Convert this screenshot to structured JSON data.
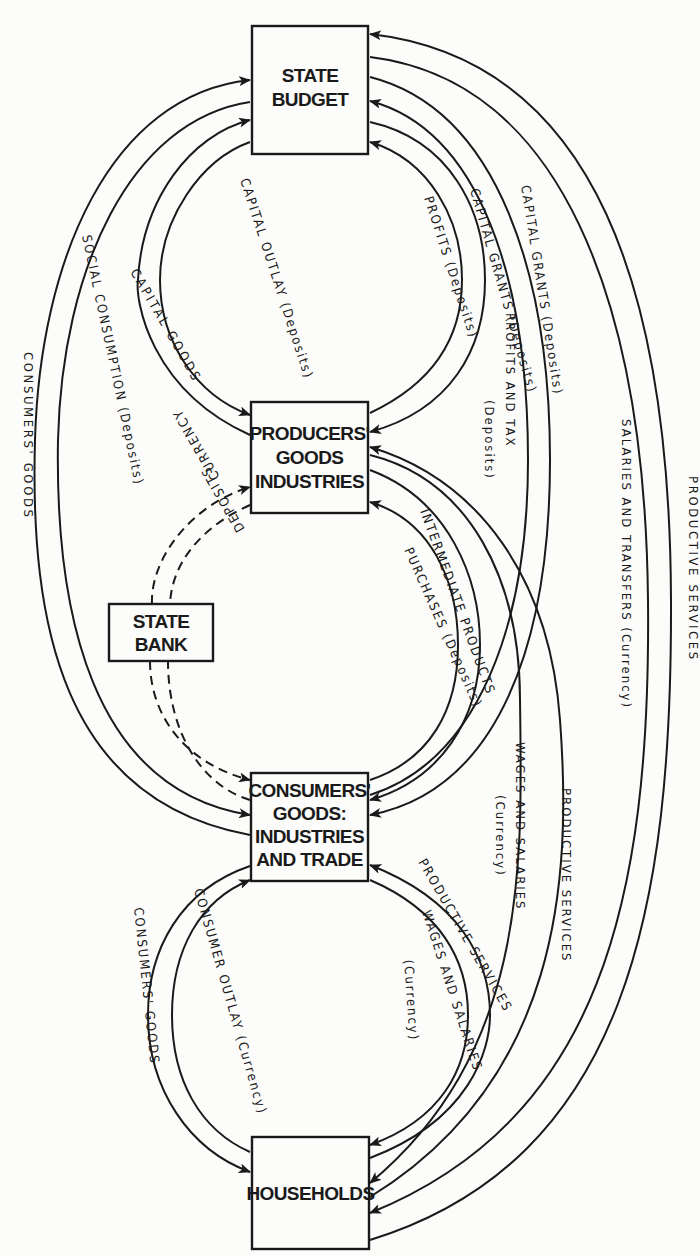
{
  "colors": {
    "ink": "#1a1a1a",
    "paper": "#fcfcfa"
  },
  "nodes": {
    "state_budget": {
      "lines": [
        "STATE",
        "BUDGET"
      ]
    },
    "producers": {
      "lines": [
        "PRODUCERS'",
        "GOODS",
        "INDUSTRIES"
      ]
    },
    "state_bank": {
      "lines": [
        "STATE",
        "BANK"
      ]
    },
    "consumers": {
      "lines": [
        "CONSUMERS'",
        "GOODS:",
        "INDUSTRIES",
        "AND TRADE"
      ]
    },
    "households": {
      "lines": [
        "HOUSEHOLDS"
      ]
    }
  },
  "flows": {
    "consumers_goods_outer": {
      "label": "CONSUMERS' GOODS",
      "from": "Consumers' Goods Industries",
      "to": "State Budget",
      "style": "solid"
    },
    "social_consumption": {
      "label": "SOCIAL CONSUMPTION (Deposits)",
      "from": "State Budget",
      "to": "Consumers' Goods Industries",
      "style": "solid"
    },
    "capital_goods": {
      "label": "CAPITAL GOODS",
      "from": "Producers' Goods Industries",
      "to": "State Budget",
      "style": "solid"
    },
    "capital_outlay": {
      "label": "CAPITAL OUTLAY (Deposits)",
      "from": "State Budget",
      "to": "Producers' Goods Industries",
      "style": "solid"
    },
    "profits_deposits": {
      "label": "PROFITS (Deposits)",
      "from": "Producers' Goods Industries",
      "to": "State Budget",
      "style": "solid"
    },
    "capital_grants_inner": {
      "label": "CAPITAL GRANTS (Deposits)",
      "from": "State Budget",
      "to": "Producers' Goods Industries",
      "style": "solid"
    },
    "profits_and_tax": {
      "label": "PROFITS AND TAX",
      "sublabel": "(Deposits)",
      "from": "Consumers' Goods Industries",
      "to": "State Budget",
      "style": "solid"
    },
    "capital_grants_outer": {
      "label": "CAPITAL GRANTS (Deposits)",
      "from": "State Budget",
      "to": "Consumers' Goods Industries",
      "style": "solid"
    },
    "salaries_transfers": {
      "label": "SALARIES AND TRANSFERS (Currency)",
      "from": "State Budget",
      "to": "Households",
      "style": "solid"
    },
    "productive_services_outer": {
      "label": "PRODUCTIVE SERVICES",
      "from": "Households",
      "to": "State Budget",
      "style": "solid"
    },
    "currency": {
      "label": "CURRENCY",
      "from": "State Bank",
      "to": "Producers' Goods Industries",
      "style": "dashed"
    },
    "deposits_upper": {
      "label": "DEPOSITS",
      "from": "Producers' Goods Industries",
      "to": "State Bank",
      "style": "dashed"
    },
    "intermediate_products": {
      "label": "INTERMEDIATE PRODUCTS",
      "from": "Producers' Goods Industries",
      "to": "Consumers' Goods Industries",
      "style": "solid"
    },
    "purchases": {
      "label": "PURCHASES (Deposits)",
      "from": "Consumers' Goods Industries",
      "to": "Producers' Goods Industries",
      "style": "solid"
    },
    "wages_salaries_producers": {
      "label": "WAGES AND SALARIES",
      "sublabel": "(Currency)",
      "from": "Producers' Goods Industries",
      "to": "Households",
      "style": "solid"
    },
    "productive_services_producers": {
      "label": "PRODUCTIVE SERVICES",
      "from": "Households",
      "to": "Producers' Goods Industries",
      "style": "solid"
    },
    "bank_to_consumers": {
      "label": "",
      "from": "State Bank",
      "to": "Consumers' Goods Industries",
      "style": "dashed"
    },
    "consumers_to_bank": {
      "label": "",
      "from": "Consumers' Goods Industries",
      "to": "State Bank",
      "style": "dashed"
    },
    "consumers_goods_inner": {
      "label": "CONSUMERS' GOODS",
      "from": "Consumers' Goods Industries",
      "to": "Households",
      "style": "solid"
    },
    "consumer_outlay": {
      "label": "CONSUMER OUTLAY (Currency)",
      "from": "Households",
      "to": "Consumers' Goods Industries",
      "style": "solid"
    },
    "productive_services_consumers": {
      "label": "PRODUCTIVE SERVICES",
      "from": "Households",
      "to": "Consumers' Goods Industries",
      "style": "solid"
    },
    "wages_salaries_consumers": {
      "label": "WAGES AND SALARIES",
      "sublabel": "(Currency)",
      "from": "Consumers' Goods Industries",
      "to": "Households",
      "style": "solid"
    }
  }
}
